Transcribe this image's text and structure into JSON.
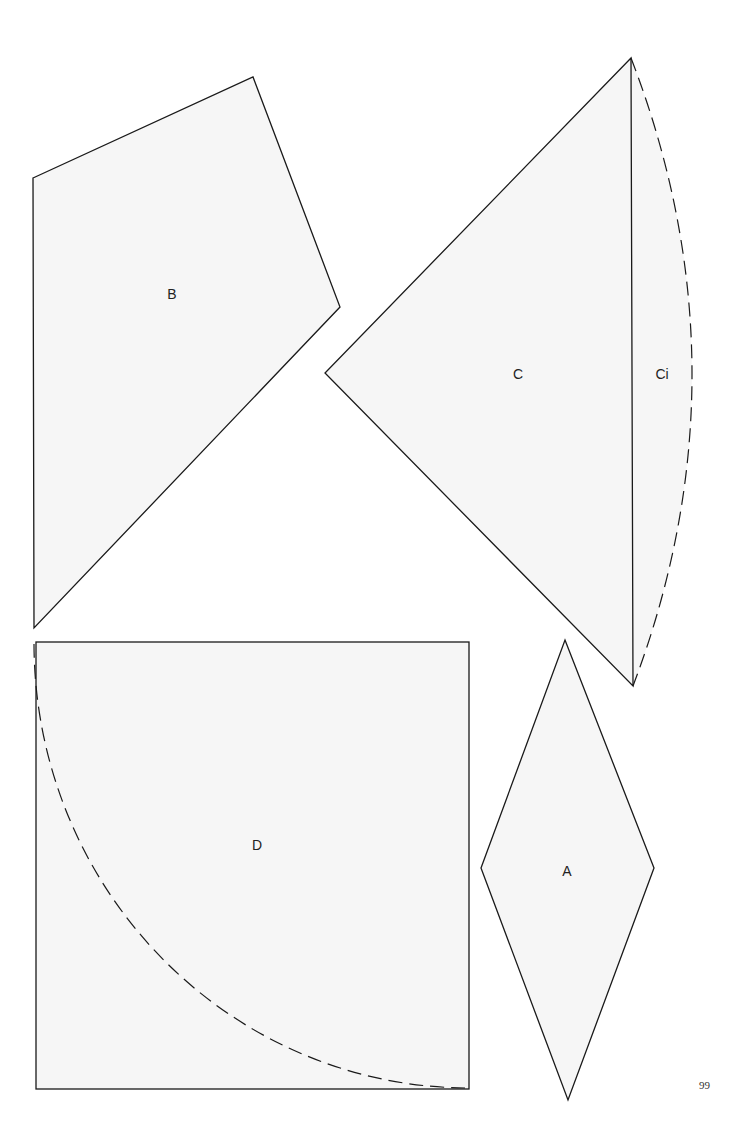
{
  "pieces": {
    "A": {
      "label": "A",
      "fill": "#f6f6f6"
    },
    "B": {
      "label": "B",
      "fill": "#f6f6f6"
    },
    "C": {
      "label": "C",
      "fill": "#f6f6f6"
    },
    "Ci": {
      "label": "Ci",
      "fill": "#f6f6f6"
    },
    "D": {
      "label": "D",
      "fill": "#f6f6f6"
    }
  },
  "page_number": "99",
  "stroke_color": "#1a1a1a"
}
